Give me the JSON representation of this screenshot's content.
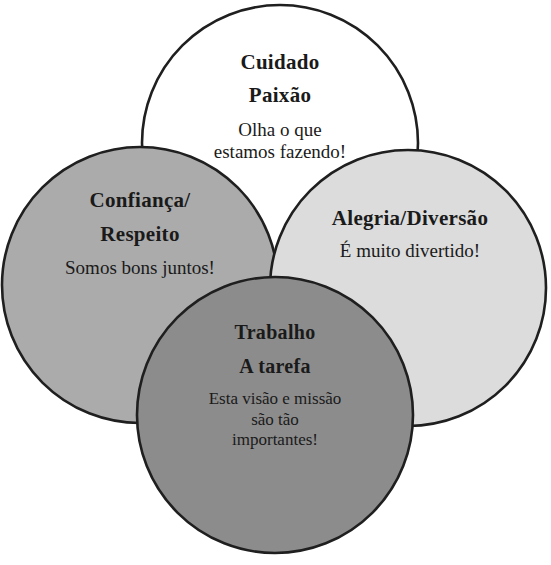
{
  "diagram": {
    "canvas": {
      "width": 551,
      "height": 565,
      "background": "#ffffff"
    },
    "stroke_color": "#1f1f1f",
    "circles": [
      {
        "id": "care",
        "name": "top-circle",
        "cx": 280,
        "cy": 143,
        "r": 138,
        "fill": "#ffffff",
        "heading": "Cuidado",
        "subheading": "Paixão",
        "caption_line_1": "Olha o que",
        "caption_line_2": "estamos fazendo!"
      },
      {
        "id": "trust",
        "name": "left-circle",
        "cx": 140,
        "cy": 285,
        "r": 138,
        "fill": "#ababab",
        "heading": "Confiança/",
        "subheading": "Respeito",
        "caption_line_1": "Somos bons juntos!",
        "caption_line_2": ""
      },
      {
        "id": "joy",
        "name": "right-circle",
        "cx": 408,
        "cy": 288,
        "r": 138,
        "fill": "#dcdcdc",
        "heading": "Alegria/Diversão",
        "subheading": "",
        "caption_line_1": "É muito divertido!",
        "caption_line_2": ""
      },
      {
        "id": "work",
        "name": "bottom-circle",
        "cx": 275,
        "cy": 415,
        "r": 138,
        "fill": "#8c8c8c",
        "heading": "Trabalho",
        "subheading": "A tarefa",
        "caption_line_1": "Esta visão e missão",
        "caption_line_2": "são tão",
        "caption_line_3": "importantes!"
      }
    ]
  }
}
